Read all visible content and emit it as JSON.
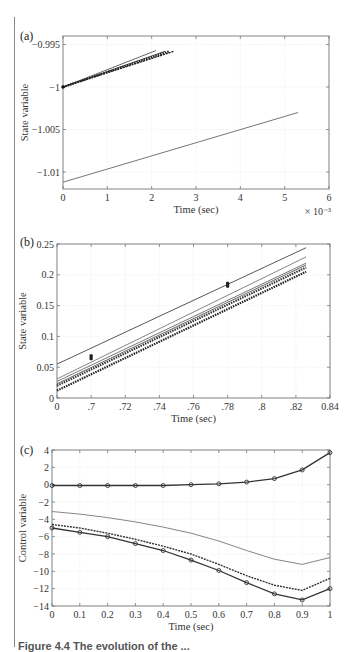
{
  "caption_partial": "Figure 4.4  The evolution of the ... ",
  "chart_data": [
    {
      "type": "line",
      "panel_label": "(a)",
      "title": "",
      "xlabel": "Time (sec)",
      "ylabel": "State variable",
      "x_multiplier_label": "× 10⁻³",
      "xlim": [
        0,
        6
      ],
      "ylim": [
        -1.012,
        -0.994
      ],
      "xticks": [
        0,
        1,
        2,
        3,
        4,
        5,
        6
      ],
      "xtick_labels": [
        "0",
        "1",
        "2",
        "3",
        "4",
        "5",
        "6"
      ],
      "yticks": [
        -0.995,
        -1,
        -1.005,
        -1.01
      ],
      "ytick_labels": [
        "−0.995",
        "−1",
        "−1.005",
        "−1.01"
      ],
      "grid": true,
      "series": [
        {
          "name": "s1",
          "style": "solid",
          "color": "#555555",
          "x": [
            0,
            2.1
          ],
          "y": [
            -1.0,
            -0.9957
          ]
        },
        {
          "name": "s2",
          "style": "solid",
          "color": "#333333",
          "x": [
            0,
            2.3
          ],
          "y": [
            -1.0,
            -0.9958
          ]
        },
        {
          "name": "s3",
          "style": "marker",
          "color": "#222222",
          "x": [
            0,
            2.4
          ],
          "y": [
            -1.0,
            -0.9958
          ]
        },
        {
          "name": "s4",
          "style": "dashed",
          "color": "#222222",
          "x": [
            0,
            2.5
          ],
          "y": [
            -1.0,
            -0.9958
          ]
        },
        {
          "name": "s5",
          "style": "solid",
          "color": "#666666",
          "x": [
            0,
            5.3
          ],
          "y": [
            -1.0112,
            -1.003
          ]
        }
      ]
    },
    {
      "type": "line",
      "panel_label": "(b)",
      "title": "",
      "xlabel": "Time (sec)",
      "ylabel": "State variable",
      "xlim": [
        0,
        8
      ],
      "ylim": [
        0,
        0.25
      ],
      "xticks": [
        0,
        1,
        2,
        3,
        4,
        5,
        6,
        7,
        8
      ],
      "xtick_labels": [
        "0",
        ".7",
        ".72",
        ".74",
        ".76",
        ".78",
        ".8",
        ".82",
        "0.84"
      ],
      "yticks": [
        0,
        0.05,
        0.1,
        0.15,
        0.2,
        0.25
      ],
      "ytick_labels": [
        "0",
        "0.05",
        "0.1",
        "0.15",
        "0.2",
        "0.25"
      ],
      "grid": true,
      "series": [
        {
          "name": "s1",
          "style": "solid",
          "color": "#444444",
          "x": [
            0,
            7.3
          ],
          "y": [
            0.055,
            0.244
          ]
        },
        {
          "name": "s2",
          "style": "solid",
          "color": "#777777",
          "x": [
            0,
            7.3
          ],
          "y": [
            0.031,
            0.229
          ]
        },
        {
          "name": "s3",
          "style": "solid",
          "color": "#666666",
          "x": [
            0,
            7.3
          ],
          "y": [
            0.027,
            0.219
          ]
        },
        {
          "name": "s4",
          "style": "solid",
          "color": "#555555",
          "x": [
            0,
            7.3
          ],
          "y": [
            0.023,
            0.216
          ]
        },
        {
          "name": "s5",
          "style": "marker",
          "color": "#333333",
          "x": [
            0,
            7.3
          ],
          "y": [
            0.02,
            0.212
          ]
        },
        {
          "name": "s6",
          "style": "marker",
          "color": "#222222",
          "x": [
            0,
            7.3
          ],
          "y": [
            0.012,
            0.205
          ]
        }
      ],
      "annotations": [
        {
          "label": "point-marker",
          "x": 1.0,
          "y": 0.066
        },
        {
          "label": "point-marker",
          "x": 5.0,
          "y": 0.184
        }
      ]
    },
    {
      "type": "line",
      "panel_label": "(c)",
      "title": "",
      "xlabel": "Time (sec)",
      "ylabel": "Control variable",
      "xlim": [
        0,
        1
      ],
      "ylim": [
        -14,
        4
      ],
      "xticks": [
        0,
        0.1,
        0.2,
        0.3,
        0.4,
        0.5,
        0.6,
        0.7,
        0.8,
        0.9,
        1
      ],
      "xtick_labels": [
        "0",
        "0.1",
        "0.2",
        "0.3",
        "0.4",
        "0.5",
        "0.6",
        "0.7",
        "0.8",
        "0.9",
        "1"
      ],
      "yticks": [
        4,
        2,
        0,
        -2,
        -4,
        -6,
        -8,
        -10,
        -12,
        -14
      ],
      "ytick_labels": [
        "4",
        "2",
        "0",
        "−2",
        "−4",
        "−6",
        "−8",
        "−10",
        "−12",
        "−14"
      ],
      "grid": true,
      "series": [
        {
          "name": "u1-circles",
          "style": "circle",
          "color": "#333333",
          "x": [
            0,
            0.1,
            0.2,
            0.3,
            0.4,
            0.5,
            0.6,
            0.7,
            0.8,
            0.9,
            1
          ],
          "y": [
            -0.1,
            -0.1,
            -0.1,
            -0.1,
            -0.1,
            0.0,
            0.1,
            0.3,
            0.7,
            1.7,
            3.7
          ]
        },
        {
          "name": "u2-thin",
          "style": "solid",
          "color": "#777777",
          "x": [
            0,
            0.1,
            0.2,
            0.3,
            0.4,
            0.5,
            0.6,
            0.7,
            0.8,
            0.9,
            1
          ],
          "y": [
            -3.1,
            -3.4,
            -3.8,
            -4.3,
            -4.9,
            -5.6,
            -6.5,
            -7.6,
            -8.6,
            -9.2,
            -8.4
          ]
        },
        {
          "name": "u3-dashed",
          "style": "dashed",
          "color": "#333333",
          "x": [
            0,
            0.1,
            0.2,
            0.3,
            0.4,
            0.5,
            0.6,
            0.7,
            0.8,
            0.9,
            1
          ],
          "y": [
            -4.6,
            -5.0,
            -5.6,
            -6.3,
            -7.1,
            -8.0,
            -9.2,
            -10.5,
            -11.6,
            -12.2,
            -10.8
          ]
        },
        {
          "name": "u4-circles",
          "style": "circle",
          "color": "#333333",
          "x": [
            0,
            0.1,
            0.2,
            0.3,
            0.4,
            0.5,
            0.6,
            0.7,
            0.8,
            0.9,
            1
          ],
          "y": [
            -5.0,
            -5.5,
            -6.0,
            -6.8,
            -7.6,
            -8.7,
            -9.9,
            -11.3,
            -12.6,
            -13.3,
            -12.0
          ]
        }
      ]
    }
  ],
  "layout": {
    "panels": [
      {
        "left": 63,
        "top": 36,
        "right": 329,
        "bottom": 189,
        "label_x": 20,
        "label_y": 40,
        "ylabel_x": 28
      },
      {
        "left": 57,
        "top": 244,
        "right": 330,
        "bottom": 398,
        "label_x": 20,
        "label_y": 246,
        "ylabel_x": 26
      },
      {
        "left": 52,
        "top": 450,
        "right": 330,
        "bottom": 606,
        "label_x": 20,
        "label_y": 454,
        "ylabel_x": 26
      }
    ]
  }
}
